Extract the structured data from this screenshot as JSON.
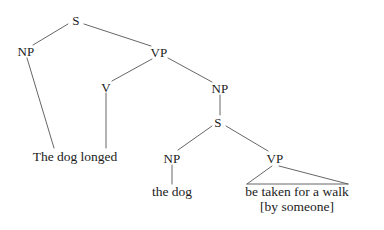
{
  "figure": {
    "kind": "syntax-tree",
    "ink_color": "#1b1b1b",
    "line_color": "#555555",
    "background_color": "#ffffff",
    "sentence": "The dog longed the dog be taken for a walk [by someone]"
  },
  "nodes": [
    {
      "id": "S",
      "label": "S",
      "x": 76,
      "y": 20
    },
    {
      "id": "NP1",
      "label": "NP",
      "x": 26,
      "y": 51
    },
    {
      "id": "VP1",
      "label": "VP",
      "x": 159,
      "y": 52
    },
    {
      "id": "V",
      "label": "V",
      "x": 106,
      "y": 87
    },
    {
      "id": "NP2",
      "label": "NP",
      "x": 220,
      "y": 88
    },
    {
      "id": "S2",
      "label": "S",
      "x": 218,
      "y": 122
    },
    {
      "id": "NP3",
      "label": "NP",
      "x": 172,
      "y": 158
    },
    {
      "id": "VP2",
      "label": "VP",
      "x": 275,
      "y": 158
    }
  ],
  "leaves": [
    {
      "id": "leaf-main",
      "label": "The dog longed",
      "x": 75,
      "y": 157
    },
    {
      "id": "leaf-the-dog",
      "label": "the dog",
      "x": 172,
      "y": 192
    },
    {
      "id": "leaf-vp-line1",
      "label": "be taken for a walk",
      "x": 297,
      "y": 192
    },
    {
      "id": "leaf-vp-line2",
      "label": "[by someone]",
      "x": 297,
      "y": 207
    }
  ],
  "edges": [
    {
      "id": "e-s-np1",
      "from": "S",
      "to": "NP1",
      "x1": 68,
      "y1": 24,
      "x2": 33,
      "y2": 45
    },
    {
      "id": "e-s-vp1",
      "from": "S",
      "to": "VP1",
      "x1": 84,
      "y1": 24,
      "x2": 151,
      "y2": 46
    },
    {
      "id": "e-np1-leaf",
      "from": "NP1",
      "to": "leaf-main",
      "x1": 27,
      "y1": 58,
      "x2": 54,
      "y2": 148
    },
    {
      "id": "e-vp1-v",
      "from": "VP1",
      "to": "V",
      "x1": 152,
      "y1": 59,
      "x2": 112,
      "y2": 81
    },
    {
      "id": "e-vp1-np2",
      "from": "VP1",
      "to": "NP2",
      "x1": 168,
      "y1": 58,
      "x2": 212,
      "y2": 82
    },
    {
      "id": "e-v-leaf",
      "from": "V",
      "to": "leaf-main",
      "x1": 106,
      "y1": 93,
      "x2": 106,
      "y2": 148
    },
    {
      "id": "e-np2-s2",
      "from": "NP2",
      "to": "S2",
      "x1": 220,
      "y1": 95,
      "x2": 220,
      "y2": 115
    },
    {
      "id": "e-s2-np3",
      "from": "S2",
      "to": "NP3",
      "x1": 212,
      "y1": 126,
      "x2": 178,
      "y2": 150
    },
    {
      "id": "e-s2-vp2",
      "from": "S2",
      "to": "VP2",
      "x1": 226,
      "y1": 126,
      "x2": 268,
      "y2": 151
    },
    {
      "id": "e-np3-leaf",
      "from": "NP3",
      "to": "leaf-the-dog",
      "x1": 172,
      "y1": 165,
      "x2": 172,
      "y2": 184
    },
    {
      "id": "e-vp2-tri-left",
      "from": "VP2",
      "to": "leaf-vp-line1",
      "x1": 272,
      "y1": 166,
      "x2": 247,
      "y2": 184
    },
    {
      "id": "e-vp2-tri-right",
      "from": "VP2",
      "to": "leaf-vp-line1",
      "x1": 279,
      "y1": 166,
      "x2": 348,
      "y2": 184
    },
    {
      "id": "e-vp2-tri-base",
      "from": "leaf-vp-line1",
      "to": "leaf-vp-line1",
      "x1": 247,
      "y1": 184,
      "x2": 348,
      "y2": 184
    }
  ]
}
